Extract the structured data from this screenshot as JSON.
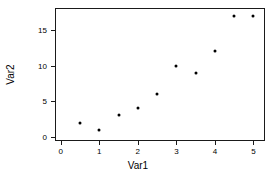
{
  "chart_data": {
    "type": "scatter",
    "title": "",
    "xlabel": "Var1",
    "ylabel": "Var2",
    "x": [
      0.5,
      1,
      1.5,
      2,
      2.5,
      3,
      3.5,
      4,
      4.5,
      5
    ],
    "y": [
      2,
      1,
      3,
      4,
      6,
      10,
      9,
      12,
      17,
      17
    ],
    "points": [
      {
        "x": 0.5,
        "y": 2
      },
      {
        "x": 1,
        "y": 1
      },
      {
        "x": 1.5,
        "y": 3
      },
      {
        "x": 2,
        "y": 4
      },
      {
        "x": 2.5,
        "y": 6
      },
      {
        "x": 3,
        "y": 10
      },
      {
        "x": 3.5,
        "y": 9
      },
      {
        "x": 4,
        "y": 12
      },
      {
        "x": 4.5,
        "y": 17
      },
      {
        "x": 5,
        "y": 17
      }
    ],
    "xticks": [
      0,
      1,
      2,
      3,
      4,
      5
    ],
    "xtick_labels": [
      "0",
      "1",
      "2",
      "3",
      "4",
      "5"
    ],
    "yticks": [
      0,
      5,
      10,
      15
    ],
    "ytick_labels": [
      "0",
      "5",
      "10",
      "15"
    ],
    "xlim": [
      -0.15,
      5.3
    ],
    "ylim": [
      -0.6,
      18.1
    ],
    "grid": false,
    "legend": null,
    "marker": "filled-circle",
    "marker_color": "#000000",
    "frame_color": "#1a1a1a",
    "background": "#ffffff"
  }
}
